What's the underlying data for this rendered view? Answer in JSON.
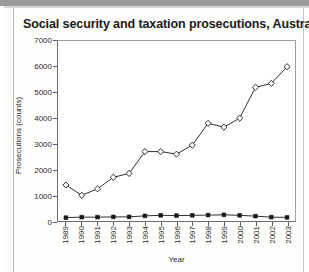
{
  "title": "Social security and taxation prosecutions, Australia",
  "axis": {
    "xtitle": "Year",
    "ytitle": "Prosecutions (counts)"
  },
  "chart_data": {
    "type": "line",
    "title": "Social security and taxation prosecutions, Australia",
    "xlabel": "Year",
    "ylabel": "Prosecutions (counts)",
    "categories": [
      "1989",
      "1990",
      "1991",
      "1992",
      "1993",
      "1994",
      "1995",
      "1996",
      "1997",
      "1998",
      "1999",
      "2000",
      "2001",
      "2002",
      "2003"
    ],
    "ylim": [
      0,
      7000
    ],
    "yticks": [
      0,
      1000,
      2000,
      3000,
      4000,
      5000,
      6000,
      7000
    ],
    "grid": false,
    "legend": "none",
    "series": [
      {
        "name": "Social security prosecutions",
        "marker": "open-diamond",
        "values": [
          1400,
          1000,
          1250,
          1700,
          1850,
          2700,
          2700,
          2600,
          2950,
          3800,
          3650,
          4000,
          5200,
          5350,
          6000
        ]
      },
      {
        "name": "Taxation prosecutions",
        "marker": "filled-circle",
        "values": [
          130,
          150,
          150,
          160,
          160,
          200,
          220,
          210,
          220,
          230,
          240,
          220,
          190,
          150,
          140
        ]
      }
    ]
  }
}
